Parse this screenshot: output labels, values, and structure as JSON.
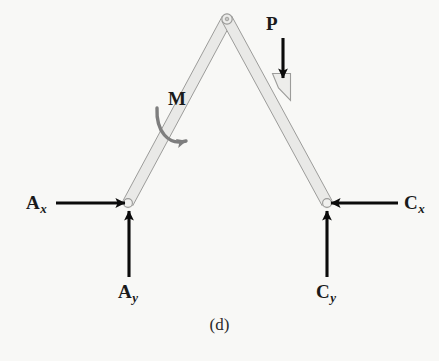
{
  "figure": {
    "caption": "(d)",
    "type": "free-body-diagram",
    "background_color": "#f8f8f6",
    "member_fill": "#e8e8e6",
    "member_stroke": "#a8a8a8",
    "force_color": "#000000",
    "moment_color": "#7a7a7a"
  },
  "labels": {
    "ax": {
      "main": "A",
      "sub": "x"
    },
    "ay": {
      "main": "A",
      "sub": "y"
    },
    "cx": {
      "main": "C",
      "sub": "x"
    },
    "cy": {
      "main": "C",
      "sub": "y"
    },
    "p": {
      "main": "P",
      "sub": ""
    },
    "m": {
      "main": "M",
      "sub": ""
    }
  },
  "geometry": {
    "apex_pin": {
      "x": 227,
      "y": 19
    },
    "left_pin": {
      "x": 128,
      "y": 203
    },
    "right_pin": {
      "x": 327,
      "y": 203
    },
    "member_width": 10
  },
  "forces": [
    {
      "name": "Ax",
      "kind": "force",
      "at": {
        "x": 128,
        "y": 203
      },
      "direction": "right",
      "tail": {
        "x": 56,
        "y": 203
      },
      "head": {
        "x": 126,
        "y": 203
      }
    },
    {
      "name": "Ay",
      "kind": "force",
      "at": {
        "x": 128,
        "y": 203
      },
      "direction": "up",
      "tail": {
        "x": 129,
        "y": 276
      },
      "head": {
        "x": 129,
        "y": 208
      }
    },
    {
      "name": "Cx",
      "kind": "force",
      "at": {
        "x": 327,
        "y": 203
      },
      "direction": "left",
      "tail": {
        "x": 398,
        "y": 203
      },
      "head": {
        "x": 330,
        "y": 203
      }
    },
    {
      "name": "Cy",
      "kind": "force",
      "at": {
        "x": 327,
        "y": 203
      },
      "direction": "up",
      "tail": {
        "x": 327,
        "y": 276
      },
      "head": {
        "x": 327,
        "y": 208
      }
    },
    {
      "name": "P",
      "kind": "force",
      "at": {
        "x": 283,
        "y": 80
      },
      "direction": "down",
      "tail": {
        "x": 283,
        "y": 39
      },
      "head": {
        "x": 283,
        "y": 82
      }
    },
    {
      "name": "M",
      "kind": "couple-moment",
      "at": {
        "x": 190,
        "y": 125
      },
      "direction": "clockwise"
    }
  ]
}
